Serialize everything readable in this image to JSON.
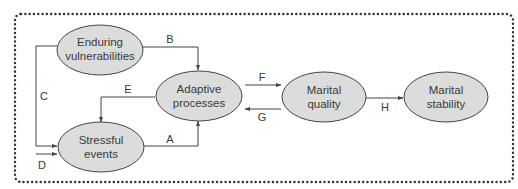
{
  "diagram": {
    "colors": {
      "node_fill": "#dcdcdc",
      "stroke": "#444444",
      "text": "#3a3a3a",
      "frame": "#333333"
    },
    "nodes": {
      "enduring": {
        "line1": "Enduring",
        "line2": "vulnerabilities"
      },
      "adaptive": {
        "line1": "Adaptive",
        "line2": "processes"
      },
      "stressful": {
        "line1": "Stressful",
        "line2": "events"
      },
      "quality": {
        "line1": "Marital",
        "line2": "quality"
      },
      "stability": {
        "line1": "Marital",
        "line2": "stability"
      }
    },
    "edges": {
      "A": "A",
      "B": "B",
      "C": "C",
      "D": "D",
      "E": "E",
      "F": "F",
      "G": "G",
      "H": "H"
    }
  }
}
